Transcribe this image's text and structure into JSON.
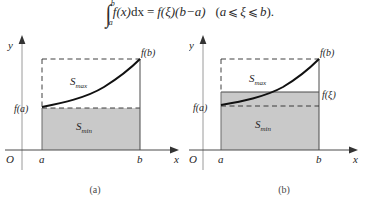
{
  "formula": {
    "integral_sign": "∫",
    "lower_limit": "a",
    "upper_limit": "b",
    "integrand": "f(x)",
    "differential": "dx",
    "equals": "=",
    "rhs_first": "f(ξ)",
    "rhs_second": "(b−a)",
    "condition_open": "(",
    "condition_left": "a",
    "le1": "⩽",
    "condition_mid": "ξ",
    "le2": "⩽",
    "condition_right": "b",
    "condition_close": ")",
    "period": "."
  },
  "figure_a": {
    "caption": "(a)",
    "y_axis_label": "y",
    "x_axis_label": "x",
    "origin_label": "O",
    "tick_a": "a",
    "tick_b": "b",
    "fa_label": "f(a)",
    "fb_label": "f(b)",
    "smax_main": "S",
    "smax_sub": "max",
    "smin_main": "S",
    "smin_sub": "min"
  },
  "figure_b": {
    "caption": "(b)",
    "y_axis_label": "y",
    "x_axis_label": "x",
    "origin_label": "O",
    "tick_a": "a",
    "tick_b": "b",
    "fa_label": "f(a)",
    "fb_label": "f(b)",
    "fxi_label": "f(ξ)",
    "smax_main": "S",
    "smax_sub": "max",
    "smin_main": "S",
    "smin_sub": "min"
  },
  "colors": {
    "shade_fill": "#c9c9c9",
    "line": "#1f1f1f",
    "dash": "#2b2b2b",
    "axis": "#333333",
    "text": "#262626",
    "background": "#ffffff"
  }
}
